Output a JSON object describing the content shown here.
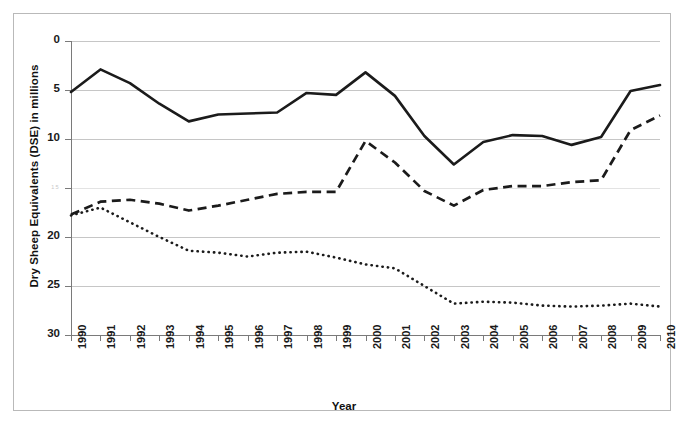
{
  "chart_data": {
    "type": "line",
    "title": "",
    "xlabel": "Year",
    "ylabel": "Dry Sheep Equivalents (DSE) in millions",
    "x": [
      1990,
      1991,
      1992,
      1993,
      1994,
      1995,
      1996,
      1997,
      1998,
      1999,
      2000,
      2001,
      2002,
      2003,
      2004,
      2005,
      2006,
      2007,
      2008,
      2009,
      2010
    ],
    "categories": [
      "1990",
      "1991",
      "1992",
      "1993",
      "1994",
      "1995",
      "1996",
      "1997",
      "1998",
      "1999",
      "2000",
      "2001",
      "2002",
      "2003",
      "2004",
      "2005",
      "2006",
      "2007",
      "2008",
      "2009",
      "2010"
    ],
    "xlim": [
      1990,
      2010
    ],
    "ylim": [
      0,
      30
    ],
    "yticks": [
      0,
      5,
      10,
      15,
      20,
      25,
      30
    ],
    "ytick_labels": [
      "0",
      "5",
      "10",
      "15",
      "20",
      "25",
      "30"
    ],
    "grid": "horizontal",
    "legend": "none",
    "series": [
      {
        "name": "series-solid",
        "style": "solid",
        "color": "#1b1b1b",
        "values": [
          24.8,
          27.1,
          25.7,
          23.6,
          21.8,
          22.5,
          22.6,
          22.7,
          24.7,
          24.5,
          26.8,
          24.4,
          20.3,
          17.4,
          19.7,
          20.4,
          20.3,
          19.4,
          20.2,
          24.9,
          25.5
        ]
      },
      {
        "name": "series-dashed",
        "style": "dashed",
        "color": "#1b1b1b",
        "values": [
          12.3,
          13.6,
          13.8,
          13.4,
          12.7,
          13.2,
          13.8,
          14.4,
          14.6,
          14.6,
          19.8,
          17.6,
          14.7,
          13.2,
          14.8,
          15.2,
          15.2,
          15.6,
          15.8,
          20.9,
          22.4
        ]
      },
      {
        "name": "series-dotted",
        "style": "dotted",
        "color": "#1b1b1b",
        "values": [
          12.2,
          13.0,
          11.5,
          10.0,
          8.6,
          8.4,
          8.0,
          8.4,
          8.5,
          7.9,
          7.2,
          6.8,
          5.0,
          3.2,
          3.4,
          3.3,
          3.0,
          2.9,
          3.0,
          3.2,
          2.9
        ]
      }
    ]
  },
  "axis": {
    "y_title": "Dry Sheep Equivalents (DSE) in millions",
    "x_title": "Year",
    "y_labels": [
      "30",
      "25",
      "20",
      "15",
      "10",
      "5",
      "0"
    ],
    "x_labels": [
      "1990",
      "1991",
      "1992",
      "1993",
      "1994",
      "1995",
      "1996",
      "1997",
      "1998",
      "1999",
      "2000",
      "2001",
      "2002",
      "2003",
      "2004",
      "2005",
      "2006",
      "2007",
      "2008",
      "2009",
      "2010"
    ]
  },
  "colors": {
    "line": "#1b1b1b",
    "grid": "#c6c6c6",
    "axis": "#7a7a7a",
    "frame": "#b9b9b9",
    "background": "#ffffff"
  }
}
